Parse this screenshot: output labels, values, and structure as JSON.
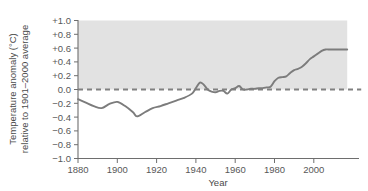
{
  "chart_data": {
    "type": "line",
    "title": "",
    "xlabel": "Year",
    "ylabel": "Temperature anomaly (°C) relative to 1901–2000 average",
    "ylabel_line1": "Temperature anomaly (°C)",
    "ylabel_line2": "relative to 1901–2000 average",
    "xlim": [
      1880,
      2023
    ],
    "ylim": [
      -1.0,
      1.0
    ],
    "grid": false,
    "legend": "none",
    "shaded_band": {
      "from": 0.0,
      "to": 1.0,
      "color": "#e2e2e2",
      "x_from": 1880,
      "x_to": 2017
    },
    "zero_reference_line": {
      "value": 0.0,
      "style": "dashed",
      "color": "#808080"
    },
    "line_color": "#7c7c7c",
    "xticks": [
      1880,
      1900,
      1920,
      1940,
      1960,
      1980,
      2000
    ],
    "xtick_labels": [
      "1880",
      "1900",
      "1920",
      "1940",
      "1960",
      "1980",
      "2000"
    ],
    "yticks": [
      1.0,
      0.8,
      0.6,
      0.4,
      0.2,
      0.0,
      -0.2,
      -0.4,
      -0.6,
      -0.8,
      -1.0
    ],
    "ytick_labels": [
      "+1.0",
      "+0.8",
      "+0.6",
      "+0.4",
      "+0.2",
      "0.0",
      "−0.2",
      "−0.4",
      "−0.6",
      "−0.8",
      "−1.0"
    ],
    "series": [
      {
        "name": "Global temperature anomaly",
        "x": [
          1880,
          1884,
          1888,
          1892,
          1896,
          1900,
          1904,
          1908,
          1910,
          1914,
          1918,
          1922,
          1926,
          1930,
          1934,
          1938,
          1940,
          1942,
          1944,
          1946,
          1948,
          1950,
          1952,
          1954,
          1956,
          1958,
          1960,
          1962,
          1964,
          1966,
          1968,
          1970,
          1972,
          1974,
          1976,
          1978,
          1980,
          1982,
          1984,
          1986,
          1988,
          1990,
          1992,
          1994,
          1996,
          1998,
          2000,
          2002,
          2004,
          2006,
          2008,
          2010,
          2012,
          2014,
          2017
        ],
        "y": [
          -0.14,
          -0.19,
          -0.24,
          -0.27,
          -0.21,
          -0.18,
          -0.24,
          -0.33,
          -0.39,
          -0.33,
          -0.27,
          -0.24,
          -0.2,
          -0.16,
          -0.12,
          -0.06,
          0.02,
          0.1,
          0.07,
          0.0,
          -0.03,
          -0.04,
          -0.02,
          -0.02,
          -0.06,
          0.0,
          0.02,
          0.05,
          0.0,
          0.0,
          0.01,
          0.01,
          0.02,
          0.02,
          0.03,
          0.04,
          0.12,
          0.17,
          0.18,
          0.19,
          0.24,
          0.28,
          0.3,
          0.33,
          0.38,
          0.44,
          0.48,
          0.52,
          0.56,
          0.58,
          0.58,
          0.58,
          0.58,
          0.58,
          0.58
        ]
      }
    ]
  }
}
